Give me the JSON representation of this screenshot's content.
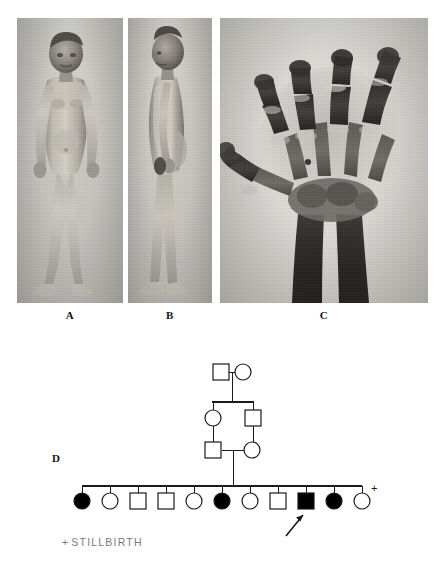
{
  "figure": {
    "panels": [
      {
        "id": "A",
        "label": "A",
        "content": "clinical-photograph-frontal-view"
      },
      {
        "id": "B",
        "label": "B",
        "content": "clinical-photograph-lateral-view"
      },
      {
        "id": "C",
        "label": "C",
        "content": "hand-radiograph"
      },
      {
        "id": "D",
        "label": "D",
        "content": "family-pedigree"
      }
    ]
  },
  "pedigree": {
    "label": "D",
    "legend": {
      "symbol": "+",
      "text": "STILLBIRTH"
    },
    "colors": {
      "line": "#1a1a1a",
      "affected_fill": "#000000",
      "unaffected_fill": "#ffffff",
      "stroke": "#1a1a1a"
    },
    "generations": [
      {
        "id": "I",
        "members": [
          {
            "id": "I-1",
            "sex": "male",
            "shape": "square",
            "affected": false
          },
          {
            "id": "I-2",
            "sex": "female",
            "shape": "circle",
            "affected": false
          }
        ],
        "relationship": "mated-pair"
      },
      {
        "id": "II",
        "members": [
          {
            "id": "II-1",
            "sex": "female",
            "shape": "circle",
            "affected": false
          },
          {
            "id": "II-2",
            "sex": "male",
            "shape": "square",
            "affected": false
          }
        ],
        "relationship": "siblings"
      },
      {
        "id": "III",
        "members": [
          {
            "id": "III-1",
            "sex": "male",
            "shape": "square",
            "affected": false
          },
          {
            "id": "III-2",
            "sex": "female",
            "shape": "circle",
            "affected": false
          }
        ],
        "relationship": "consanguineous-mated-pair"
      },
      {
        "id": "IV",
        "relationship": "sibship",
        "members": [
          {
            "id": "IV-1",
            "sex": "female",
            "shape": "circle",
            "affected": true,
            "proband": false,
            "stillbirth": false
          },
          {
            "id": "IV-2",
            "sex": "female",
            "shape": "circle",
            "affected": false,
            "proband": false,
            "stillbirth": false
          },
          {
            "id": "IV-3",
            "sex": "male",
            "shape": "square",
            "affected": false,
            "proband": false,
            "stillbirth": false
          },
          {
            "id": "IV-4",
            "sex": "male",
            "shape": "square",
            "affected": false,
            "proband": false,
            "stillbirth": false
          },
          {
            "id": "IV-5",
            "sex": "female",
            "shape": "circle",
            "affected": false,
            "proband": false,
            "stillbirth": false
          },
          {
            "id": "IV-6",
            "sex": "female",
            "shape": "circle",
            "affected": true,
            "proband": false,
            "stillbirth": false
          },
          {
            "id": "IV-7",
            "sex": "female",
            "shape": "circle",
            "affected": false,
            "proband": false,
            "stillbirth": false
          },
          {
            "id": "IV-8",
            "sex": "male",
            "shape": "square",
            "affected": false,
            "proband": false,
            "stillbirth": false
          },
          {
            "id": "IV-9",
            "sex": "male",
            "shape": "square",
            "affected": true,
            "proband": true,
            "stillbirth": false
          },
          {
            "id": "IV-10",
            "sex": "female",
            "shape": "circle",
            "affected": true,
            "proband": false,
            "stillbirth": false
          },
          {
            "id": "IV-11",
            "sex": "female",
            "shape": "circle",
            "affected": false,
            "proband": false,
            "stillbirth": true
          }
        ]
      }
    ],
    "proband_marker": "arrow"
  }
}
